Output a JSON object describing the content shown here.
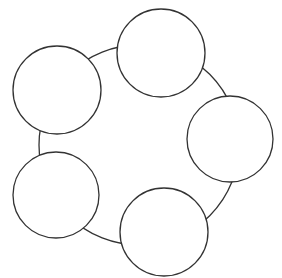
{
  "diagram": {
    "type": "cycle",
    "stroke_color": "#333333",
    "fill_color": "#ffffff",
    "ring": {
      "cx": 139,
      "cy": 145,
      "r": 100
    },
    "nodes": [
      {
        "id": "node-top",
        "cx": 161,
        "cy": 53,
        "r": 44,
        "label": ""
      },
      {
        "id": "node-right",
        "cx": 230,
        "cy": 139,
        "r": 43,
        "label": ""
      },
      {
        "id": "node-bottom",
        "cx": 164,
        "cy": 232,
        "r": 44,
        "label": ""
      },
      {
        "id": "node-bottom-left",
        "cx": 56,
        "cy": 195,
        "r": 43,
        "label": ""
      },
      {
        "id": "node-top-left",
        "cx": 57,
        "cy": 90,
        "r": 44,
        "label": ""
      }
    ]
  }
}
